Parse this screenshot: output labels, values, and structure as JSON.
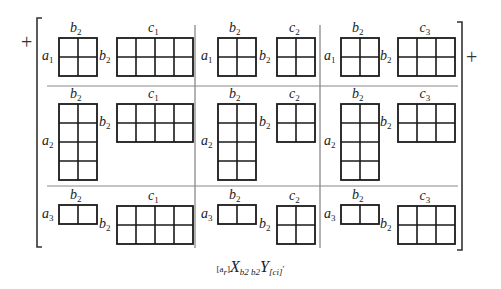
{
  "figure": {
    "prefix_sign": "+",
    "suffix_sign": "+",
    "columns": [
      {
        "id": "col1",
        "left_var": "b",
        "left_sub": "2",
        "right_var": "c",
        "right_sub": "1",
        "cols": 4
      },
      {
        "id": "col2",
        "left_var": "b",
        "left_sub": "2",
        "right_var": "c",
        "right_sub": "2",
        "cols": 2
      },
      {
        "id": "col3",
        "left_var": "b",
        "left_sub": "2",
        "right_var": "c",
        "right_sub": "3",
        "cols": 3
      }
    ],
    "rows": [
      {
        "id": "row1",
        "row_var": "a",
        "row_sub": "1",
        "a_rows": 2
      },
      {
        "id": "row2",
        "row_var": "a",
        "row_sub": "2",
        "a_rows": 4
      },
      {
        "id": "row3",
        "row_var": "a",
        "row_sub": "3",
        "a_rows": 1
      }
    ],
    "b_var": "b",
    "b_sub": "2",
    "b_rows": 2,
    "b_cols": 2
  },
  "caption": {
    "left_index": "[a",
    "left_index_sub": "r",
    "left_index_close": "]",
    "x": "X",
    "x_sub": "b",
    "x_sub_sub": "2",
    "mid": "b",
    "mid_sub": "2",
    "y": "Y",
    "right_index": "[c",
    "right_index_sub": "i",
    "right_index_close": "]",
    "trailing": "′"
  },
  "colors": {
    "ink": "#1a1a1a",
    "rule": "#555555",
    "background": "#ffffff"
  }
}
